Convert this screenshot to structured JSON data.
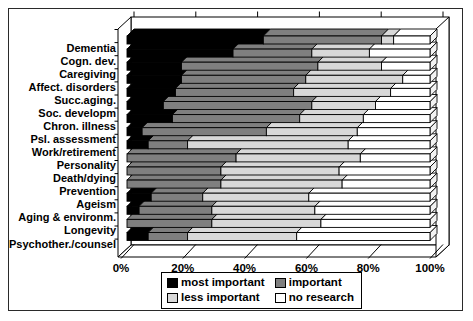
{
  "chart_data": {
    "type": "bar",
    "subtype": "stacked-horizontal-3d",
    "title": "",
    "xlabel": "",
    "ylabel": "",
    "unit": "percent",
    "xlim": [
      0,
      100
    ],
    "x_tick_labels": [
      "0%",
      "20%",
      "40%",
      "60%",
      "80%",
      "100%"
    ],
    "grid": false,
    "legend_position": "bottom",
    "categories": [
      "Dementia",
      "Cogn. dev.",
      "Caregiving",
      "Affect. disorders",
      "Succ.aging.",
      "Soc. developm",
      "Chron. illness",
      "Psl. assessment",
      "Work/retirement",
      "Personality",
      "Death/dying",
      "Prevention",
      "Ageism",
      "Aging & environm.",
      "Longevity",
      "Psychother./counsel"
    ],
    "series": [
      {
        "name": "most important",
        "color": "#000000",
        "values": [
          45,
          35,
          18,
          18,
          16,
          12,
          15,
          5,
          7,
          0,
          0,
          0,
          8,
          4,
          0,
          7
        ]
      },
      {
        "name": "important",
        "color": "#7f7f7f",
        "values": [
          39,
          26,
          45,
          41,
          39,
          49,
          42,
          41,
          13,
          36,
          31,
          31,
          17,
          24,
          28,
          13
        ]
      },
      {
        "name": "less important",
        "color": "#d8d8d8",
        "values": [
          4,
          19,
          21,
          32,
          32,
          21,
          21,
          30,
          53,
          41,
          39,
          40,
          35,
          34,
          36,
          36
        ]
      },
      {
        "name": "no research",
        "color": "#ffffff",
        "values": [
          12,
          20,
          16,
          9,
          13,
          18,
          22,
          24,
          27,
          23,
          30,
          29,
          40,
          38,
          36,
          44
        ]
      }
    ]
  },
  "style": {
    "stroke": "#000000",
    "wall_fill": "#ffffff",
    "end_cap_fill": "#f2f2f2",
    "frame_border": "#2a2a2a"
  }
}
